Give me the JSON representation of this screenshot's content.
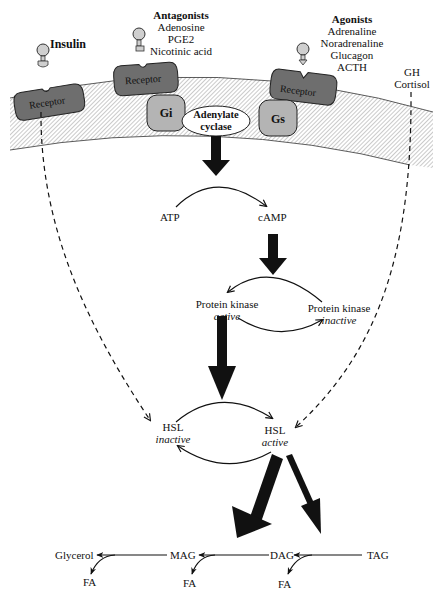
{
  "ligands": {
    "insulin": {
      "label": "Insulin"
    },
    "antagonists": {
      "heading": "Antagonists",
      "items": [
        "Adenosine",
        "PGE2",
        "Nicotinic acid"
      ]
    },
    "agonists": {
      "heading": "Agonists",
      "items": [
        "Adrenaline",
        "Noradrenaline",
        "Glucagon",
        "ACTH"
      ]
    },
    "gh_cortisol": {
      "items": [
        "GH",
        "Cortisol"
      ]
    }
  },
  "membrane": {
    "receptors": [
      {
        "label": "Receptor"
      },
      {
        "label": "Receptor"
      },
      {
        "label": "Receptor"
      }
    ],
    "gi": {
      "label": "Gi"
    },
    "gs": {
      "label": "Gs"
    },
    "adenylate_cyclase": {
      "line1": "Adenylate",
      "line2": "cyclase"
    }
  },
  "pathway": {
    "atp": "ATP",
    "camp": "cAMP",
    "pk_active": {
      "name": "Protein kinase",
      "state": "active"
    },
    "pk_inactive": {
      "name": "Protein kinase",
      "state": "inactive"
    },
    "hsl_inactive": {
      "name": "HSL",
      "state": "inactive"
    },
    "hsl_active": {
      "name": "HSL",
      "state": "active"
    }
  },
  "lipolysis": {
    "glycerol": "Glycerol",
    "mag": "MAG",
    "dag": "DAG",
    "tag": "TAG",
    "fa": [
      "FA",
      "FA",
      "FA"
    ]
  },
  "colors": {
    "ink": "#111111",
    "receptor_fill": "#6e6e6e",
    "g_protein_fill": "#b4b4b4",
    "ligand_fill": "#cfcfcf",
    "membrane_hatch": "#9a9a9a"
  }
}
